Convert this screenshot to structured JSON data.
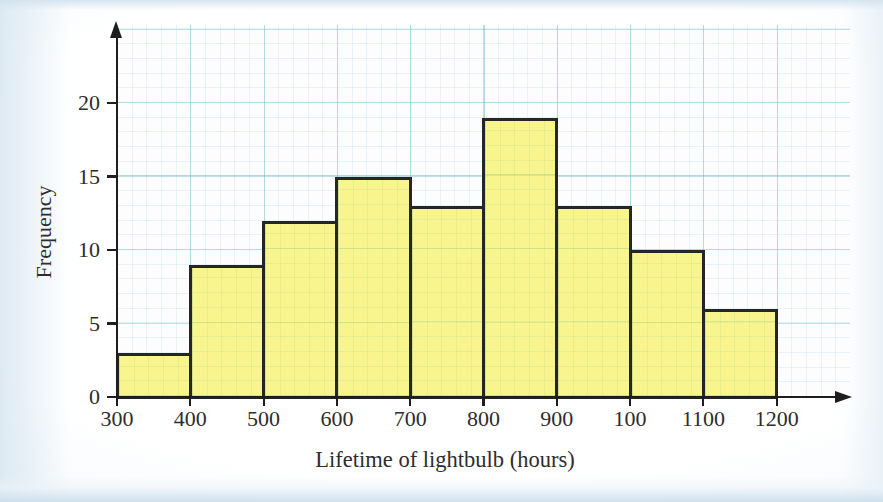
{
  "chart_data": {
    "type": "bar",
    "subtype": "histogram",
    "title": "",
    "xlabel": "Lifetime of lightbulb (hours)",
    "ylabel": "Frequency",
    "bin_edges": [
      300,
      400,
      500,
      600,
      700,
      800,
      900,
      1000,
      1100,
      1200
    ],
    "x_tick_labels": [
      "300",
      "400",
      "500",
      "600",
      "700",
      "800",
      "900",
      "100",
      "1100",
      "1200"
    ],
    "values": [
      3,
      9,
      12,
      15,
      13,
      19,
      13,
      10,
      6
    ],
    "y_tick_values": [
      0,
      5,
      10,
      15,
      20
    ],
    "y_tick_labels": [
      "0",
      "5",
      "10",
      "15",
      "20"
    ],
    "ylim": [
      0,
      25
    ],
    "xlim": [
      300,
      1300
    ],
    "grid": true,
    "legend": "none",
    "colors": {
      "bar_fill": "#f8f48e",
      "bar_border": "#262626",
      "grid_minor": "#ddeef1",
      "grid_major": "#bfe2e8",
      "axis": "#1e1e1e",
      "text": "#2d2d2d",
      "plot_background": "#fdfdfe",
      "page_background": "#e8eff5"
    }
  }
}
